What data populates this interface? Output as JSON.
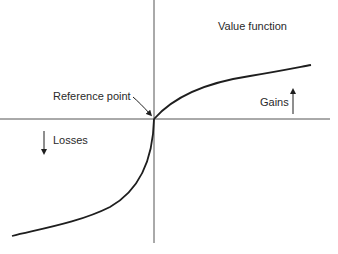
{
  "diagram": {
    "title": "Value function",
    "labels": {
      "reference_point": "Reference point",
      "gains": "Gains",
      "losses": "Losses"
    },
    "colors": {
      "line": "#1e1e1e",
      "axis": "#4a4a4a",
      "text": "#2a2a2a"
    }
  }
}
